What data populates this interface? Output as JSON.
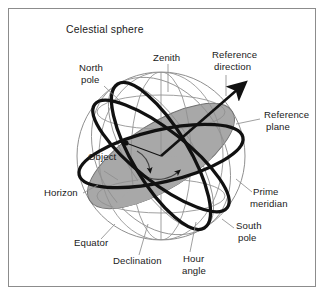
{
  "figure": {
    "title": "Celestial sphere",
    "frame": {
      "border_color": "#8c8c8c",
      "background": "#ffffff"
    }
  },
  "colors": {
    "plane_fill": "#a8a8a8",
    "plane_fill_light": "#bdbdbd",
    "great_circle": "#111111",
    "thin_line": "#8f8f8f",
    "leader_line": "#8f8f8f",
    "text": "#1a1a1a"
  },
  "sphere": {
    "center_x": 161,
    "center_y": 156,
    "radius": 84
  },
  "labels": [
    {
      "id": "celestial-sphere",
      "text": "Celestial sphere",
      "x": 66,
      "y": 33
    },
    {
      "id": "zenith",
      "text": "Zenith",
      "x": 153,
      "y": 61
    },
    {
      "id": "reference-direction-1",
      "text": "Reference",
      "x": 212,
      "y": 58
    },
    {
      "id": "reference-direction-2",
      "text": "direction",
      "x": 214,
      "y": 70
    },
    {
      "id": "north-pole-1",
      "text": "North",
      "x": 79,
      "y": 71
    },
    {
      "id": "north-pole-2",
      "text": "pole",
      "x": 81,
      "y": 83
    },
    {
      "id": "reference-plane-1",
      "text": "Reference",
      "x": 264,
      "y": 118
    },
    {
      "id": "reference-plane-2",
      "text": "plane",
      "x": 266,
      "y": 130
    },
    {
      "id": "object",
      "text": "Object",
      "x": 88,
      "y": 160
    },
    {
      "id": "horizon",
      "text": "Horizon",
      "x": 44,
      "y": 196
    },
    {
      "id": "prime-meridian-1",
      "text": "Prime",
      "x": 253,
      "y": 195
    },
    {
      "id": "prime-meridian-2",
      "text": "meridian",
      "x": 250,
      "y": 207
    },
    {
      "id": "south-pole-1",
      "text": "South",
      "x": 236,
      "y": 229
    },
    {
      "id": "south-pole-2",
      "text": "pole",
      "x": 238,
      "y": 241
    },
    {
      "id": "equator",
      "text": "Equator",
      "x": 74,
      "y": 246
    },
    {
      "id": "declination",
      "text": "Declination",
      "x": 113,
      "y": 264
    },
    {
      "id": "hour-angle-1",
      "text": "Hour",
      "x": 183,
      "y": 262
    },
    {
      "id": "hour-angle-2",
      "text": "angle",
      "x": 182,
      "y": 274
    }
  ],
  "annotations": {
    "reference_direction_arrow": "arrow from sphere center to upper-right, piercing sphere surface",
    "object_marker": "point on the declination great circle, upper-left of center",
    "angle_arcs": "two small curved arrows at the sphere center marking declination and hour angle"
  }
}
